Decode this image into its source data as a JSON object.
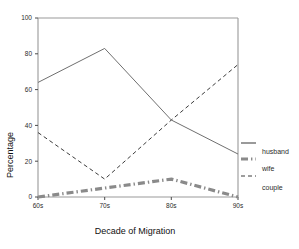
{
  "chart_data": {
    "type": "line",
    "title": "",
    "xlabel": "Decade of Migration",
    "ylabel": "Percentage",
    "categories": [
      "60s",
      "70s",
      "80s",
      "90s"
    ],
    "xtick_labels": [
      "60s",
      "70s",
      "80s",
      "90s"
    ],
    "ytick_labels": [
      "0",
      "20",
      "40",
      "60",
      "80",
      "100"
    ],
    "ytick_values": [
      0,
      20,
      40,
      60,
      80,
      100
    ],
    "ylim": [
      0,
      100
    ],
    "grid": false,
    "legend_position": "right",
    "series": [
      {
        "name": "husband",
        "style": "solid",
        "color": "#6f6f6f",
        "values": [
          64,
          83,
          43,
          24
        ]
      },
      {
        "name": "wife",
        "style": "thick-dash-dot",
        "color": "#8a8a8a",
        "values": [
          0,
          5,
          10,
          0
        ]
      },
      {
        "name": "couple",
        "style": "dashed",
        "color": "#3c3c3c",
        "values": [
          36,
          10,
          43,
          74
        ]
      }
    ],
    "legend_entries": [
      {
        "label": "husband",
        "style": "solid",
        "color": "#6f6f6f"
      },
      {
        "label": "wife",
        "style": "thick-dash-dot",
        "color": "#8a8a8a"
      },
      {
        "label": "couple",
        "style": "dashed",
        "color": "#3c3c3c"
      }
    ]
  }
}
